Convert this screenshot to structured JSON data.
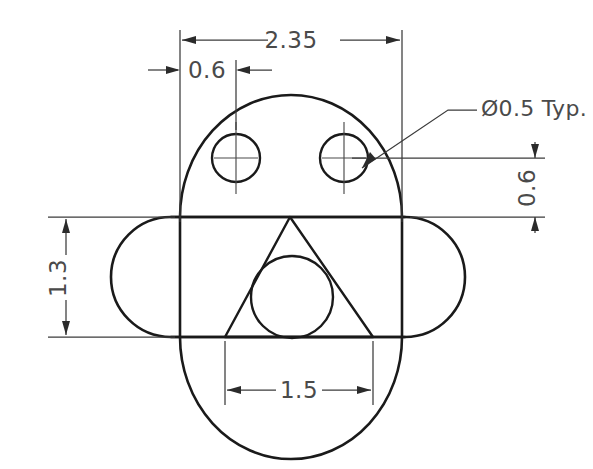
{
  "drawing": {
    "title": "Mechanical Part Outline Drawing",
    "background_color": "#ffffff",
    "line_color": "#1a1a1a",
    "dimension_color": "#4a4a4a",
    "units_note": "",
    "dimensions": [
      {
        "id": "overall-width",
        "label": "2.35",
        "orientation": "horizontal",
        "position": "top",
        "value": 2.35
      },
      {
        "id": "hole-edge-offset",
        "label": "0.6",
        "orientation": "horizontal",
        "position": "top-left",
        "value": 0.6
      },
      {
        "id": "hole-vertical-offset",
        "label": "0.6",
        "orientation": "vertical",
        "position": "right",
        "value": 0.6
      },
      {
        "id": "slot-height",
        "label": "1.3",
        "orientation": "vertical",
        "position": "left",
        "value": 1.3
      },
      {
        "id": "triangle-base-width",
        "label": "1.5",
        "orientation": "horizontal",
        "position": "bottom",
        "value": 1.5
      }
    ],
    "notes": [
      {
        "id": "hole-diameter-note",
        "label": "Ø0.5 Typ.",
        "diameter": 0.5,
        "applies_to": "both-holes"
      }
    ],
    "features": [
      {
        "id": "body-outline",
        "type": "rounded-body",
        "description": "Upper dome and lower semicircle body"
      },
      {
        "id": "horizontal-slot",
        "type": "stadium",
        "description": "Horizontal rounded slot across the middle"
      },
      {
        "id": "triangle",
        "type": "triangle",
        "description": "Equilateral triangle inside the slot"
      },
      {
        "id": "inscribed-circle",
        "type": "circle",
        "description": "Circle inscribed in the triangle"
      },
      {
        "id": "hole-left",
        "type": "circle",
        "description": "Left Ø0.5 hole with centerlines"
      },
      {
        "id": "hole-right",
        "type": "circle",
        "description": "Right Ø0.5 hole with centerlines"
      }
    ]
  }
}
